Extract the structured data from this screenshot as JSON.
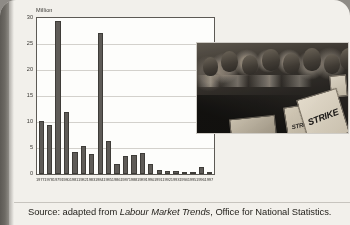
{
  "page": {
    "caption_prefix": "Source: adapted from ",
    "caption_publication": "Labour Market Trends",
    "caption_suffix": ", Office for National Statistics."
  },
  "photo": {
    "alt_name": "striking-workers-photograph",
    "placard_main_text": "STRIKE",
    "placard_second_text": "STRIKE"
  },
  "chart_data": {
    "type": "bar",
    "title": "",
    "xlabel": "",
    "ylabel": "Million",
    "ylim": [
      0,
      30
    ],
    "yticks": [
      0,
      5,
      10,
      15,
      20,
      25,
      30
    ],
    "ytick_labels": [
      "0",
      "5",
      "10",
      "15",
      "20",
      "25",
      "30"
    ],
    "grid": true,
    "legend": "none",
    "bar_color": "#5e5b57",
    "categories": [
      "1977",
      "1978",
      "1979",
      "1980",
      "1981",
      "1982",
      "1983",
      "1984",
      "1985",
      "1986",
      "1987",
      "1988",
      "1989",
      "1990",
      "1991",
      "1992",
      "1993",
      "1994",
      "1995",
      "1996",
      "1997"
    ],
    "values": [
      10.1,
      9.4,
      29.5,
      11.9,
      4.3,
      5.3,
      3.8,
      27.1,
      6.4,
      1.9,
      3.5,
      3.7,
      4.1,
      1.9,
      0.8,
      0.5,
      0.6,
      0.3,
      0.4,
      1.3,
      0.2
    ]
  }
}
